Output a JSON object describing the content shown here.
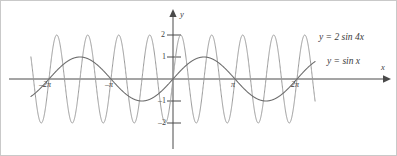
{
  "figure": {
    "name": "trigonometric-function-graph",
    "background_color": "#ffffff",
    "border_color": "#c9c9c9"
  },
  "axes": {
    "x_axis_label": "x",
    "y_axis_label": "y",
    "axis_color": "#4a4a4a",
    "origin_px": {
      "x": 172,
      "y": 78
    },
    "x_unit_px_per_pi": 62,
    "y_unit_px": 22,
    "x_ticks": [
      {
        "label": "–2π",
        "value": -6.283185
      },
      {
        "label": "–π",
        "value": -3.141593
      },
      {
        "label": "π",
        "value": 3.141593
      },
      {
        "label": "2π",
        "value": 6.283185
      }
    ],
    "y_ticks": [
      {
        "label": "2",
        "value": 2
      },
      {
        "label": "1",
        "value": 1
      },
      {
        "label": "–1",
        "value": -1
      },
      {
        "label": "–2",
        "value": -2
      }
    ]
  },
  "legend": {
    "items": [
      {
        "label": "y = 2 sin 4x",
        "color": "#9a9a9a"
      },
      {
        "label": "y = sin x",
        "color": "#6e6e6e"
      }
    ]
  },
  "chart_data": {
    "type": "line",
    "title": "",
    "xlabel": "x",
    "ylabel": "y",
    "xlim": [
      -7.6,
      7.6
    ],
    "ylim": [
      -2.6,
      2.6
    ],
    "grid": false,
    "legend_position": "right",
    "x_tick_labels": [
      "–2π",
      "–π",
      "π",
      "2π"
    ],
    "x_tick_values": [
      -6.283185,
      -3.141593,
      3.141593,
      6.283185
    ],
    "y_tick_labels": [
      "2",
      "1",
      "–1",
      "–2"
    ],
    "y_tick_values": [
      2,
      1,
      -1,
      -2
    ],
    "series": [
      {
        "name": "y = 2 sin 4x",
        "expression": "2*sin(4*x)",
        "amplitude": 2,
        "frequency": 4,
        "period": 1.570796,
        "color": "#9a9a9a",
        "line_width": 1.0,
        "x_domain": [
          -7.2,
          7.2
        ]
      },
      {
        "name": "y = sin x",
        "expression": "sin(x)",
        "amplitude": 1,
        "frequency": 1,
        "period": 6.283185,
        "color": "#6e6e6e",
        "line_width": 1.1,
        "x_domain": [
          -7.2,
          7.2
        ]
      }
    ]
  }
}
